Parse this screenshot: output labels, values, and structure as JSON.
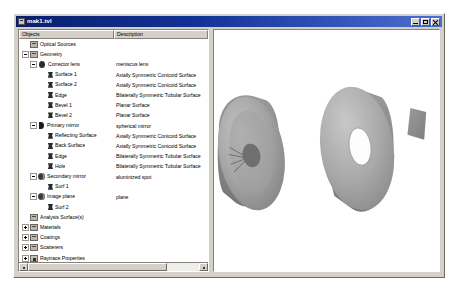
{
  "window": {
    "title": "mak1.tvl",
    "icon": "app-document-icon",
    "controls": {
      "minimize": "minimize-button",
      "maximize": "maximize-button",
      "close": "close-button"
    }
  },
  "tree": {
    "columns": {
      "objects": "Objects",
      "description": "Description"
    },
    "rows": [
      {
        "label": "Optical Sources",
        "description": "",
        "depth": 1,
        "icon": "folder-icon",
        "expander": "none"
      },
      {
        "label": "Geometry",
        "description": "",
        "depth": 1,
        "icon": "folder-icon",
        "expander": "minus"
      },
      {
        "label": "Corrector lens",
        "description": "meniscus lens",
        "depth": 2,
        "icon": "lens-icon",
        "expander": "minus"
      },
      {
        "label": "Surface 1",
        "description": "Axially Symmetric Conicoid Surface",
        "depth": 3,
        "icon": "surface-icon",
        "expander": "none"
      },
      {
        "label": "Surface 2",
        "description": "Axially Symmetric Conicoid Surface",
        "depth": 3,
        "icon": "surface-icon",
        "expander": "none"
      },
      {
        "label": "Edge",
        "description": "Bilaterally Symmetric Tubular Surface",
        "depth": 3,
        "icon": "surface-icon",
        "expander": "none"
      },
      {
        "label": "Bevel 1",
        "description": "Planar Surface",
        "depth": 3,
        "icon": "surface-icon",
        "expander": "none"
      },
      {
        "label": "Bevel 2",
        "description": "Planar Surface",
        "depth": 3,
        "icon": "surface-icon",
        "expander": "none"
      },
      {
        "label": "Primary mirror",
        "description": "spherical mirror",
        "depth": 2,
        "icon": "mirror-icon",
        "expander": "minus"
      },
      {
        "label": "Reflecting Surface",
        "description": "Axially Symmetric Conicoid Surface",
        "depth": 3,
        "icon": "surface-icon",
        "expander": "none"
      },
      {
        "label": "Back Surface",
        "description": "Axially Symmetric Conicoid Surface",
        "depth": 3,
        "icon": "surface-icon",
        "expander": "none"
      },
      {
        "label": "Edge",
        "description": "Bilaterally Symmetric Tubular Surface",
        "depth": 3,
        "icon": "surface-icon",
        "expander": "none"
      },
      {
        "label": "Hole",
        "description": "Bilaterally Symmetric Tubular Surface",
        "depth": 3,
        "icon": "surface-icon",
        "expander": "none"
      },
      {
        "label": "Secondary mirror",
        "description": "aluminized spot",
        "depth": 2,
        "icon": "perspective-icon",
        "expander": "minus"
      },
      {
        "label": "Surf 1",
        "description": "",
        "depth": 3,
        "icon": "surface-icon",
        "expander": "none"
      },
      {
        "label": "Image plane",
        "description": "plane",
        "depth": 2,
        "icon": "perspective-icon",
        "expander": "minus"
      },
      {
        "label": "Surf 2",
        "description": "",
        "depth": 3,
        "icon": "surface-icon",
        "expander": "none"
      },
      {
        "label": "Analysis Surface(s)",
        "description": "",
        "depth": 1,
        "icon": "folder-icon",
        "expander": "none"
      },
      {
        "label": "Materials",
        "description": "",
        "depth": 1,
        "icon": "folder-icon",
        "expander": "plus"
      },
      {
        "label": "Coatings",
        "description": "",
        "depth": 1,
        "icon": "folder-icon",
        "expander": "plus"
      },
      {
        "label": "Scatterers",
        "description": "",
        "depth": 1,
        "icon": "folder-icon",
        "expander": "plus"
      },
      {
        "label": "Raytrace Properties",
        "description": "",
        "depth": 1,
        "icon": "properties-icon",
        "expander": "plus"
      }
    ],
    "scrollbar": {
      "left_arrow": "scroll-left-arrow",
      "right_arrow": "scroll-right-arrow",
      "thumb": "horizontal-scroll-thumb"
    }
  },
  "viewport": {
    "name": "3d-optical-layout",
    "background": "#ffffff",
    "objects": [
      {
        "name": "primary-mirror",
        "shape": "concave-disc",
        "detail": "aluminized spot with rays",
        "color": "#9d9d9d"
      },
      {
        "name": "corrector-lens",
        "shape": "annular-disc",
        "detail": "central hole",
        "color": "#a8a8a8"
      },
      {
        "name": "image-plane",
        "shape": "small-quad",
        "color": "#8f8f8f"
      }
    ]
  }
}
